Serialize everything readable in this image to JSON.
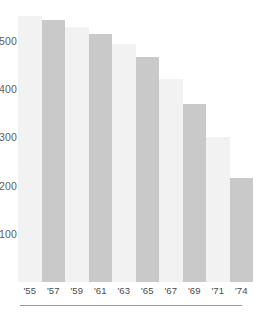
{
  "chart_data": {
    "type": "bar",
    "title": "",
    "subtitle": "",
    "xlabel": "",
    "ylabel": "",
    "categories": [
      "'55",
      "'57",
      "'59",
      "'61",
      "'63",
      "'65",
      "'67",
      "'69",
      "'71",
      "'74"
    ],
    "values": [
      551,
      543,
      528,
      514,
      493,
      466,
      421,
      369,
      300,
      215
    ],
    "series": [
      {
        "name": "",
        "values": [
          551,
          543,
          528,
          514,
          493,
          466,
          421,
          369,
          300,
          215
        ]
      }
    ],
    "ytick_labels": [
      "500",
      "400",
      "300",
      "200",
      "100"
    ],
    "ytick_values": [
      500,
      400,
      300,
      200,
      100
    ],
    "ylim": [
      0,
      585
    ],
    "grid": false,
    "legend": null,
    "legend_position": "none",
    "bar_colors": [
      "#f2f2f2",
      "#c9c9c9",
      "#f2f2f2",
      "#c9c9c9",
      "#f2f2f2",
      "#c9c9c9",
      "#f2f2f2",
      "#c9c9c9",
      "#f2f2f2",
      "#c9c9c9"
    ],
    "colors": {
      "bar_light": "#f2f2f2",
      "bar_dark": "#c9c9c9",
      "axis_text": "#4a4a4a",
      "ytick_text": "#5d5d5d",
      "axis_rule": "#9a9a9a",
      "background": "#ffffff"
    }
  }
}
